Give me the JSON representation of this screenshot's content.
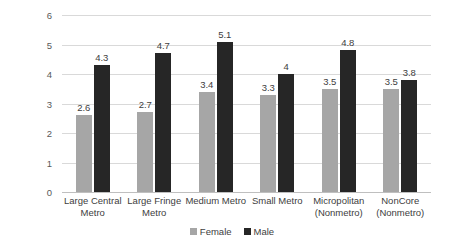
{
  "chart_data": {
    "type": "bar",
    "title": "",
    "subtitle": "",
    "xlabel": "",
    "ylabel": "Death Rate Per 100,000",
    "ylim": [
      0,
      6
    ],
    "ytick_step": 1,
    "yticks": [
      "0",
      "1",
      "2",
      "3",
      "4",
      "5",
      "6"
    ],
    "grid": true,
    "legend_position": "bottom-center",
    "categories": [
      "Large Central Metro",
      "Large Fringe Metro",
      "Medium Metro",
      "Small Metro",
      "Micropolitan (Nonmetro)",
      "NonCore (Nonmetro)"
    ],
    "category_lines": [
      [
        "Large Central",
        "Metro"
      ],
      [
        "Large Fringe",
        "Metro"
      ],
      [
        "Medium Metro"
      ],
      [
        "Small Metro"
      ],
      [
        "Micropolitan",
        "(Nonmetro)"
      ],
      [
        "NonCore",
        "(Nonmetro)"
      ]
    ],
    "series": [
      {
        "name": "Female",
        "color": "#a6a6a6",
        "values": [
          2.6,
          2.7,
          3.4,
          3.3,
          3.5,
          3.5
        ],
        "labels": [
          "2.6",
          "2.7",
          "3.4",
          "3.3",
          "3.5",
          "3.5"
        ]
      },
      {
        "name": "Male",
        "color": "#262626",
        "values": [
          4.3,
          4.7,
          5.1,
          4.0,
          4.8,
          3.8
        ],
        "labels": [
          "4.3",
          "4.7",
          "5.1",
          "4",
          "4.8",
          "3.8"
        ]
      }
    ]
  },
  "colors": {
    "female": "#a6a6a6",
    "male": "#262626",
    "gridline": "#d9d9d9",
    "axis": "#bfbfbf",
    "text": "#404040",
    "tick_text": "#595959",
    "background": "#ffffff"
  }
}
